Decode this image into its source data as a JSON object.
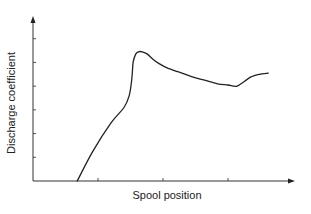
{
  "chart_data": {
    "type": "line",
    "title": "",
    "xlabel": "Spool position",
    "ylabel": "Discharge coefficient",
    "xlim": [
      0,
      10
    ],
    "ylim": [
      0,
      7
    ],
    "x_ticks": [
      2.5,
      5.0,
      7.5
    ],
    "y_ticks": [
      1,
      2,
      3,
      4,
      5,
      6
    ],
    "tick_labels_shown": false,
    "grid": false,
    "legend": null,
    "series": [
      {
        "name": "Discharge coefficient",
        "color": "#222222",
        "x": [
          1.7,
          2.3,
          3.0,
          3.5,
          3.7,
          3.8,
          3.85,
          3.95,
          4.05,
          4.2,
          4.4,
          4.6,
          4.85,
          5.2,
          5.6,
          6.1,
          6.6,
          7.1,
          7.5,
          7.7,
          7.85,
          8.0,
          8.4,
          8.7,
          9.05
        ],
        "values": [
          0.0,
          1.25,
          2.45,
          3.1,
          3.6,
          4.3,
          5.0,
          5.35,
          5.45,
          5.45,
          5.35,
          5.15,
          4.95,
          4.75,
          4.6,
          4.4,
          4.25,
          4.1,
          4.05,
          4.0,
          4.0,
          4.1,
          4.4,
          4.5,
          4.55
        ]
      }
    ]
  }
}
